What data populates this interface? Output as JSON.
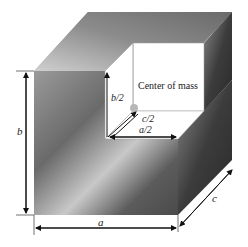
{
  "diagram": {
    "type": "3d-block-with-quadrant-cutout",
    "labels": {
      "a": "a",
      "b": "b",
      "c": "c",
      "a_half": "a/2",
      "b_half": "b/2",
      "c_half": "c/2",
      "center_of_mass": "Center of mass"
    },
    "colors": {
      "background": "#ffffff",
      "metal_dark": "#3a3a3a",
      "metal_mid": "#8a8a8a",
      "metal_light": "#d8d8d8",
      "cutout": "#ffffff",
      "center_point": "#b8b8b8",
      "dimension_line": "#111111"
    }
  }
}
